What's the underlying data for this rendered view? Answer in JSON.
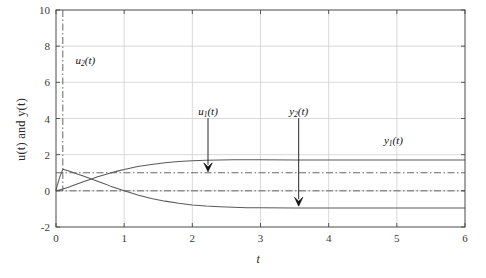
{
  "chart_data": {
    "type": "line",
    "title": "",
    "xlabel": "t",
    "ylabel": "u(t) and y(t)",
    "xlim": [
      0,
      6
    ],
    "ylim": [
      -2,
      10
    ],
    "xticks": [
      "0",
      "1",
      "2",
      "3",
      "4",
      "5",
      "6"
    ],
    "xtick_values": [
      0,
      1,
      2,
      3,
      4,
      5,
      6
    ],
    "yticks": [
      "-2",
      "0",
      "2",
      "4",
      "6",
      "8",
      "10"
    ],
    "ytick_values": [
      -2,
      0,
      2,
      4,
      6,
      8,
      10
    ],
    "grid": true,
    "legend": "none (inline annotated labels with arrows)",
    "series": [
      {
        "name": "y1(t)",
        "label": "y1(t)",
        "style": "solid",
        "color": "#5a5a5a",
        "description": "Rises from 0, overshoots slightly and settles near 1.7",
        "x": [
          0,
          0.05,
          0.1,
          0.15,
          0.2,
          0.3,
          0.4,
          0.5,
          0.6,
          0.7,
          0.8,
          0.9,
          1.0,
          1.2,
          1.4,
          1.6,
          1.8,
          2.0,
          2.2,
          2.4,
          2.6,
          2.8,
          3.0,
          3.5,
          4.0,
          4.5,
          5.0,
          5.5,
          6.0
        ],
        "y": [
          0.0,
          0.05,
          0.1,
          0.16,
          0.22,
          0.36,
          0.5,
          0.63,
          0.76,
          0.88,
          0.99,
          1.09,
          1.18,
          1.34,
          1.46,
          1.55,
          1.62,
          1.66,
          1.69,
          1.71,
          1.72,
          1.72,
          1.72,
          1.71,
          1.7,
          1.7,
          1.7,
          1.7,
          1.7
        ]
      },
      {
        "name": "y2(t)",
        "label": "y2(t)",
        "style": "solid",
        "color": "#5a5a5a",
        "description": "Spikes to about 1.2 near t=0.1 then decays to about -0.95",
        "x": [
          0,
          0.05,
          0.1,
          0.15,
          0.2,
          0.3,
          0.4,
          0.5,
          0.6,
          0.7,
          0.8,
          0.9,
          1.0,
          1.2,
          1.4,
          1.6,
          1.8,
          2.0,
          2.2,
          2.4,
          2.6,
          2.8,
          3.0,
          3.5,
          4.0,
          4.5,
          5.0,
          5.5,
          6.0
        ],
        "y": [
          0.05,
          0.7,
          1.2,
          1.14,
          1.08,
          0.95,
          0.82,
          0.68,
          0.54,
          0.4,
          0.26,
          0.13,
          0.0,
          -0.23,
          -0.42,
          -0.57,
          -0.69,
          -0.78,
          -0.84,
          -0.88,
          -0.91,
          -0.93,
          -0.94,
          -0.95,
          -0.95,
          -0.95,
          -0.95,
          -0.95,
          -0.95
        ]
      },
      {
        "name": "u1(t)",
        "label": "u1(t)",
        "style": "dash-dot",
        "color": "#555555",
        "description": "Constant step reference held at 1",
        "x": [
          0,
          6
        ],
        "y": [
          1,
          1
        ]
      },
      {
        "name": "u2(t)",
        "label": "u2(t)",
        "style": "dash-dot",
        "color": "#555555",
        "description": "Zero baseline plus vertical impulse line at t = 0.1",
        "x": [
          0,
          6
        ],
        "y": [
          0,
          0
        ],
        "impulse_t": 0.1,
        "impulse_top": 10
      }
    ],
    "annotations": [
      {
        "name": "u2-label",
        "text_base": "u",
        "text_sub": "2",
        "text_tail": "(t)",
        "x": 0.43,
        "y": 7.2,
        "arrow": false
      },
      {
        "name": "u1-label",
        "text_base": "u",
        "text_sub": "1",
        "text_tail": "(t)",
        "x": 2.23,
        "y": 4.35,
        "arrow": true,
        "arrow_to_y": 1.05
      },
      {
        "name": "y2-label",
        "text_base": "y",
        "text_sub": "2",
        "text_tail": "(t)",
        "x": 3.56,
        "y": 4.35,
        "arrow": true,
        "arrow_to_y": -0.85
      },
      {
        "name": "y1-label",
        "text_base": "y",
        "text_sub": "1",
        "text_tail": "(t)",
        "x": 4.95,
        "y": 2.75,
        "arrow": false
      }
    ],
    "colors": {
      "axis": "#4a4a4a",
      "grid": "#cfcfcf",
      "curve": "#5a5a5a",
      "reference": "#555555",
      "arrow": "#111111",
      "background": "#ffffff"
    }
  }
}
